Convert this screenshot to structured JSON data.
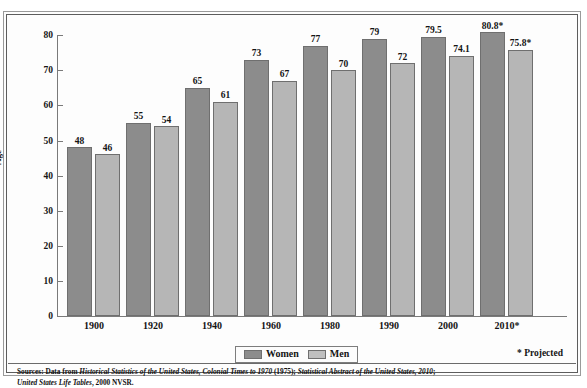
{
  "chart_data": {
    "type": "bar",
    "title": "",
    "xlabel": "",
    "ylabel": "Age",
    "ylim": [
      0,
      80
    ],
    "yticks": [
      0,
      10,
      20,
      30,
      40,
      50,
      60,
      70,
      80
    ],
    "grid": false,
    "legend_position": "bottom-center",
    "categories": [
      "1900",
      "1920",
      "1940",
      "1960",
      "1980",
      "1990",
      "2000",
      "2010*"
    ],
    "series": [
      {
        "name": "Women",
        "color": "#8c8c8c",
        "values": [
          48,
          55,
          65,
          73,
          77,
          79,
          79.5,
          80.8
        ],
        "labels": [
          "48",
          "55",
          "65",
          "73",
          "77",
          "79",
          "79.5",
          "80.8*"
        ]
      },
      {
        "name": "Men",
        "color": "#b6b6b6",
        "values": [
          46,
          54,
          61,
          67,
          70,
          72,
          74.1,
          75.8
        ],
        "labels": [
          "46",
          "54",
          "61",
          "67",
          "70",
          "72",
          "74.1",
          "75.8*"
        ]
      }
    ],
    "annotations": [
      "* Projected"
    ]
  },
  "axis": {
    "y_title": "Age",
    "y_tick_labels": [
      "80",
      "70",
      "60",
      "50",
      "40",
      "30",
      "20",
      "10",
      "0"
    ],
    "x_tick_labels": [
      "1900",
      "1920",
      "1940",
      "1960",
      "1980",
      "1990",
      "2000",
      "2010*"
    ]
  },
  "legend": {
    "items": [
      {
        "label": "Women",
        "swatch": "women"
      },
      {
        "label": "Men",
        "swatch": "men"
      }
    ]
  },
  "footnote": {
    "projected": "* Projected"
  },
  "sources": {
    "line1_prefix": "Sources: Data from ",
    "line1_italic1": "Historical Statistics of the United States, Colonial Times to 1970",
    "line1_mid": " (1975); ",
    "line1_italic2": "Statistical Abstract of the United States, 2010",
    "line1_suffix": ";",
    "line2_italic": "United States Life Tables",
    "line2_suffix": ", 2000 NVSR."
  }
}
